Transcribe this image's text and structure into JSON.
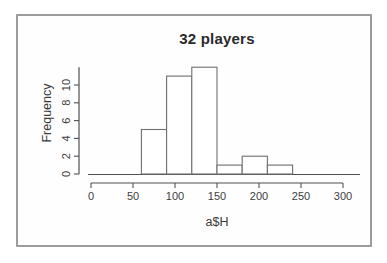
{
  "chart_data": {
    "type": "histogram",
    "title": "32 players",
    "xlabel": "a$H",
    "ylabel": "Frequency",
    "bins": [
      {
        "start": 60,
        "end": 90,
        "count": 5
      },
      {
        "start": 90,
        "end": 120,
        "count": 11
      },
      {
        "start": 120,
        "end": 150,
        "count": 12
      },
      {
        "start": 150,
        "end": 180,
        "count": 1
      },
      {
        "start": 180,
        "end": 210,
        "count": 2
      },
      {
        "start": 210,
        "end": 240,
        "count": 1
      }
    ],
    "x_ticks": [
      0,
      50,
      100,
      150,
      200,
      250,
      300
    ],
    "y_ticks": [
      0,
      2,
      4,
      6,
      8,
      10
    ],
    "xlim": [
      0,
      300
    ],
    "ylim": [
      0,
      12
    ],
    "grid": false,
    "legend": null,
    "colors": {
      "bar_fill": "#ffffff",
      "bar_stroke": "#6f6f6f",
      "axis": "#4f4f4f",
      "tick_text": "#3d3d3d",
      "frame_border": "#9c9c9c",
      "background": "#ffffff"
    }
  }
}
